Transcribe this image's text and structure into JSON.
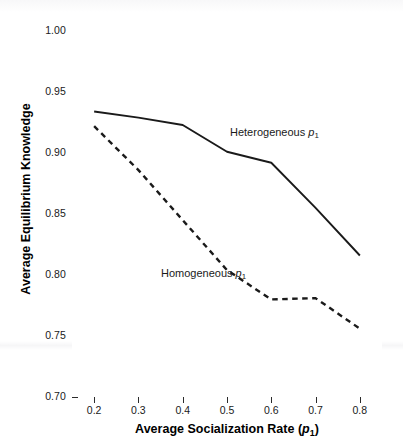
{
  "chart_data": {
    "type": "line",
    "title": "",
    "subtitle": "",
    "xlabel_plain": "Average Socialization Rate (p1)",
    "ylabel_plain": "Average Equilibrium Knowledge",
    "xlabel_parts": {
      "text": "Average Socialization Rate (",
      "italic": "p",
      "subscript": "1",
      "tail": ")"
    },
    "ylabel": "Average Equilibrium Knowledge",
    "x": [
      0.2,
      0.3,
      0.4,
      0.5,
      0.6,
      0.7,
      0.8
    ],
    "xlim": [
      0.15,
      0.85
    ],
    "ylim": [
      0.7,
      1.0
    ],
    "xticks": [
      "0.2",
      "0.3",
      "0.4",
      "0.5",
      "0.6",
      "0.7",
      "0.8"
    ],
    "yticks": [
      "0.70",
      "0.75",
      "0.80",
      "0.85",
      "0.90",
      "0.95",
      "1.00"
    ],
    "grid": false,
    "legend_position": "inline-annotations",
    "series": [
      {
        "name": "Heterogeneous p1",
        "label_text": "Heterogeneous ",
        "label_italic": "p",
        "label_subscript": "1",
        "style": "solid",
        "color": "#1a1a1a",
        "values": [
          0.934,
          0.929,
          0.923,
          0.901,
          0.892,
          0.855,
          0.816
        ]
      },
      {
        "name": "Homogeneous p1",
        "label_text": "Homogeneous ",
        "label_italic": "p",
        "label_subscript": "1",
        "style": "dashed",
        "color": "#1a1a1a",
        "values": [
          0.922,
          0.886,
          0.845,
          0.804,
          0.78,
          0.781,
          0.756
        ]
      }
    ],
    "annotations": [
      {
        "text": "Heterogeneous p1",
        "x": 0.43,
        "y": 0.952
      },
      {
        "text": "Homogeneous p1",
        "x": 0.22,
        "y": 0.838
      }
    ]
  },
  "colors": {
    "axis": "#2b2b2b",
    "series": "#1a1a1a",
    "background": "#ffffff"
  }
}
